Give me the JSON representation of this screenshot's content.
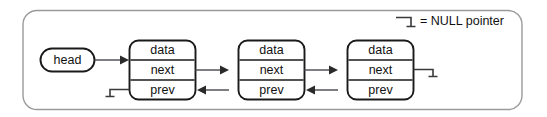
{
  "diagram": {
    "legend": {
      "symbol_name": "null-pointer-symbol",
      "text": "= NULL pointer"
    },
    "head": {
      "label": "head"
    },
    "fields": {
      "data": "data",
      "next": "next",
      "prev": "prev"
    },
    "nodes": [
      {
        "id": "node-1",
        "data_label": "data",
        "next_label": "next",
        "prev_label": "prev",
        "prev_is_null": true,
        "next_is_null": false
      },
      {
        "id": "node-2",
        "data_label": "data",
        "next_label": "next",
        "prev_label": "prev",
        "prev_is_null": false,
        "next_is_null": false
      },
      {
        "id": "node-3",
        "data_label": "data",
        "next_label": "next",
        "prev_label": "prev",
        "prev_is_null": false,
        "next_is_null": true
      }
    ],
    "colors": {
      "stroke": "#1a1a1a",
      "link": "#55555a",
      "outer_border": "#9a9a9a",
      "background": "#ffffff"
    }
  }
}
